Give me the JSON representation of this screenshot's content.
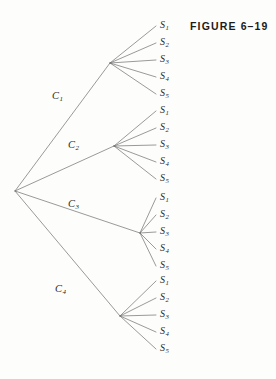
{
  "figure": {
    "caption": "FIGURE 6–19",
    "caption_x": 190,
    "caption_y": 20
  },
  "style": {
    "background": "#fdfdfc",
    "line_color": "#6e6e6e",
    "text_color": "#2a2a2a",
    "caption_color": "#1b1b1b",
    "line_width": 0.7
  },
  "chart_data": {
    "type": "tree",
    "title": "FIGURE 6–19",
    "root": {
      "x": 15,
      "y": 191
    },
    "branch_labels": [
      "C",
      "C",
      "C",
      "C"
    ],
    "leaf_labels": [
      "S",
      "S",
      "S",
      "S",
      "S"
    ],
    "branches": [
      {
        "id": "C1",
        "label_base": "C",
        "label_sub": "1",
        "label_x": 52,
        "label_y": 97,
        "node": {
          "x": 110,
          "y": 63
        },
        "leaf_x": 160,
        "leaves": [
          {
            "base": "S",
            "sub": "1",
            "y": 26
          },
          {
            "base": "S",
            "sub": "2",
            "y": 43
          },
          {
            "base": "S",
            "sub": "3",
            "y": 60
          },
          {
            "base": "S",
            "sub": "4",
            "y": 77
          },
          {
            "base": "S",
            "sub": "5",
            "y": 94
          }
        ]
      },
      {
        "id": "C2",
        "label_base": "C",
        "label_sub": "2",
        "label_x": 68,
        "label_y": 146,
        "node": {
          "x": 114,
          "y": 146
        },
        "leaf_x": 160,
        "leaves": [
          {
            "base": "S",
            "sub": "1",
            "y": 111
          },
          {
            "base": "S",
            "sub": "2",
            "y": 128
          },
          {
            "base": "S",
            "sub": "3",
            "y": 145
          },
          {
            "base": "S",
            "sub": "4",
            "y": 162
          },
          {
            "base": "S",
            "sub": "5",
            "y": 179
          }
        ]
      },
      {
        "id": "C3",
        "label_base": "C",
        "label_sub": "3",
        "label_x": 68,
        "label_y": 205,
        "node": {
          "x": 140,
          "y": 233
        },
        "leaf_x": 160,
        "leaves": [
          {
            "base": "S",
            "sub": "1",
            "y": 198
          },
          {
            "base": "S",
            "sub": "2",
            "y": 215
          },
          {
            "base": "S",
            "sub": "3",
            "y": 232
          },
          {
            "base": "S",
            "sub": "4",
            "y": 249
          },
          {
            "base": "S",
            "sub": "5",
            "y": 266
          }
        ]
      },
      {
        "id": "C4",
        "label_base": "C",
        "label_sub": "4",
        "label_x": 55,
        "label_y": 290,
        "node": {
          "x": 120,
          "y": 316
        },
        "leaf_x": 160,
        "leaves": [
          {
            "base": "S",
            "sub": "1",
            "y": 281
          },
          {
            "base": "S",
            "sub": "2",
            "y": 298
          },
          {
            "base": "S",
            "sub": "3",
            "y": 315
          },
          {
            "base": "S",
            "sub": "4",
            "y": 332
          },
          {
            "base": "S",
            "sub": "5",
            "y": 349
          }
        ]
      }
    ]
  }
}
